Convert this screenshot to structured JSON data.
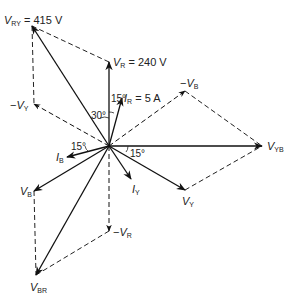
{
  "diagram": {
    "type": "phasor-diagram",
    "origin": [
      109,
      146
    ],
    "phasors": [
      {
        "id": "V_RY",
        "sym": "V",
        "sub": "RY",
        "suffix": "= 415 V",
        "to": [
          32,
          26
        ],
        "style": "solid",
        "label_pos": [
          4,
          15
        ]
      },
      {
        "id": "V_R",
        "sym": "V",
        "sub": "R",
        "suffix": "= 240 V",
        "to": [
          109,
          62
        ],
        "style": "solid",
        "label_pos": [
          113,
          57
        ]
      },
      {
        "id": "I_R",
        "sym": "I",
        "sub": "R",
        "suffix": "= 5 A",
        "to": [
          122,
          98
        ],
        "style": "solid",
        "label_pos": [
          124,
          93
        ]
      },
      {
        "id": "minus_V_B",
        "sym": "V",
        "sub": "B",
        "prefix": "−",
        "to": [
          185,
          91
        ],
        "style": "dashed",
        "label_pos": [
          180,
          78
        ]
      },
      {
        "id": "V_YB",
        "sym": "V",
        "sub": "YB",
        "to": [
          262,
          146
        ],
        "style": "solid",
        "label_pos": [
          267,
          141
        ]
      },
      {
        "id": "V_Y",
        "sym": "V",
        "sub": "Y",
        "to": [
          185,
          190
        ],
        "style": "solid",
        "label_pos": [
          182,
          196
        ]
      },
      {
        "id": "I_Y",
        "sym": "I",
        "sub": "Y",
        "to": [
          131,
          179
        ],
        "style": "solid",
        "label_pos": [
          132,
          184
        ]
      },
      {
        "id": "I_B",
        "sym": "I",
        "sub": "B",
        "to": [
          67,
          157
        ],
        "style": "solid",
        "label_pos": [
          56,
          152
        ]
      },
      {
        "id": "V_B",
        "sym": "V",
        "sub": "B",
        "to": [
          34,
          191
        ],
        "style": "solid",
        "label_pos": [
          20,
          186
        ]
      },
      {
        "id": "minus_V_R",
        "sym": "V",
        "sub": "R",
        "prefix": "−",
        "to": [
          109,
          231
        ],
        "style": "dashed",
        "label_pos": [
          113,
          227
        ]
      },
      {
        "id": "V_BR",
        "sym": "V",
        "sub": "BR",
        "to": [
          36,
          275
        ],
        "style": "solid",
        "label_pos": [
          30,
          282
        ]
      },
      {
        "id": "minus_V_Y",
        "sym": "V",
        "sub": "Y",
        "prefix": "−",
        "to": [
          34,
          104
        ],
        "style": "dashed",
        "label_pos": [
          10,
          100
        ]
      }
    ],
    "construction_lines": [
      {
        "from": [
          32,
          26
        ],
        "to": [
          109,
          62
        ]
      },
      {
        "from": [
          32,
          26
        ],
        "to": [
          34,
          104
        ]
      },
      {
        "from": [
          185,
          91
        ],
        "to": [
          262,
          146
        ]
      },
      {
        "from": [
          185,
          190
        ],
        "to": [
          262,
          146
        ]
      },
      {
        "from": [
          34,
          191
        ],
        "to": [
          36,
          275
        ]
      },
      {
        "from": [
          109,
          231
        ],
        "to": [
          36,
          275
        ]
      }
    ],
    "angles": [
      {
        "text": "30°",
        "pos": [
          91,
          111
        ]
      },
      {
        "text": "15°",
        "pos": [
          111,
          94
        ]
      },
      {
        "text": "15°",
        "pos": [
          71,
          142
        ]
      },
      {
        "text": "15°",
        "pos": [
          130,
          149
        ]
      }
    ]
  }
}
